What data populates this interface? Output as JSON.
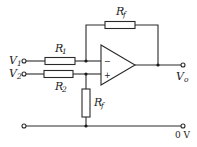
{
  "diagram": {
    "labels": {
      "v1": {
        "main": "V",
        "sub": "1"
      },
      "v2": {
        "main": "V",
        "sub": "2"
      },
      "vo": {
        "main": "V",
        "sub": "o"
      },
      "r1": {
        "main": "R",
        "sub": "1"
      },
      "r2": {
        "main": "R",
        "sub": "2"
      },
      "rf_top": {
        "main": "R",
        "sub": "f"
      },
      "rf_bottom": {
        "main": "R",
        "sub": "f"
      },
      "ground": "0 V",
      "inverting": "−",
      "non_inverting": "+"
    },
    "colors": {
      "line": "#2a2a2a",
      "background": "#ffffff"
    }
  }
}
